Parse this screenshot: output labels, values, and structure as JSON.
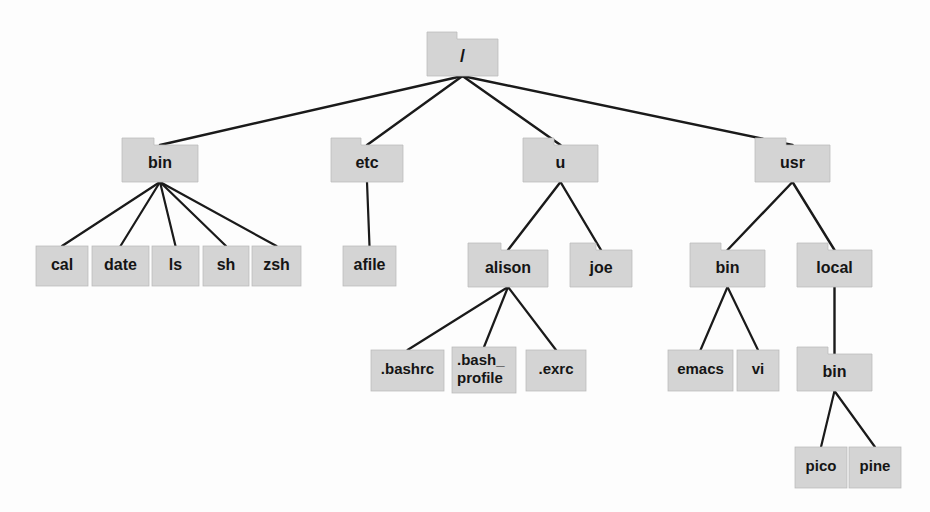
{
  "diagram": {
    "type": "tree",
    "background_color": "#fdfdfd",
    "node_fill_color": "#d4d4d4",
    "node_stroke_color": "#b9b9b9",
    "edge_color": "#1a1a1a",
    "text_color": "#151515"
  },
  "nodes": [
    {
      "id": "root",
      "label": "/",
      "kind": "folder",
      "x": 427,
      "y": 32,
      "w": 71,
      "h": 44,
      "tab_w": 30,
      "tab_h": 7,
      "font_size": 18,
      "lines": [
        "/"
      ]
    },
    {
      "id": "bin",
      "label": "bin",
      "kind": "folder",
      "x": 122,
      "y": 138,
      "w": 76,
      "h": 44,
      "tab_w": 32,
      "tab_h": 7,
      "font_size": 16,
      "lines": [
        "bin"
      ]
    },
    {
      "id": "etc",
      "label": "etc",
      "kind": "folder",
      "x": 331,
      "y": 138,
      "w": 72,
      "h": 44,
      "tab_w": 30,
      "tab_h": 7,
      "font_size": 16,
      "lines": [
        "etc"
      ]
    },
    {
      "id": "u",
      "label": "u",
      "kind": "folder",
      "x": 523,
      "y": 138,
      "w": 75,
      "h": 44,
      "tab_w": 31,
      "tab_h": 7,
      "font_size": 16,
      "lines": [
        "u"
      ]
    },
    {
      "id": "usr",
      "label": "usr",
      "kind": "folder",
      "x": 755,
      "y": 138,
      "w": 75,
      "h": 44,
      "tab_w": 31,
      "tab_h": 7,
      "font_size": 16,
      "lines": [
        "usr"
      ]
    },
    {
      "id": "cal",
      "label": "cal",
      "kind": "file",
      "x": 36,
      "y": 246,
      "w": 52,
      "h": 40,
      "font_size": 16,
      "lines": [
        "cal"
      ]
    },
    {
      "id": "date",
      "label": "date",
      "kind": "file",
      "x": 92,
      "y": 246,
      "w": 57,
      "h": 40,
      "font_size": 16,
      "lines": [
        "date"
      ]
    },
    {
      "id": "ls",
      "label": "ls",
      "kind": "file",
      "x": 152,
      "y": 246,
      "w": 47,
      "h": 40,
      "font_size": 16,
      "lines": [
        "ls"
      ]
    },
    {
      "id": "sh",
      "label": "sh",
      "kind": "file",
      "x": 203,
      "y": 246,
      "w": 46,
      "h": 40,
      "font_size": 16,
      "lines": [
        "sh"
      ]
    },
    {
      "id": "zsh",
      "label": "zsh",
      "kind": "file",
      "x": 252,
      "y": 246,
      "w": 49,
      "h": 40,
      "font_size": 16,
      "lines": [
        "zsh"
      ]
    },
    {
      "id": "afile",
      "label": "afile",
      "kind": "file",
      "x": 343,
      "y": 246,
      "w": 53,
      "h": 40,
      "font_size": 16,
      "lines": [
        "afile"
      ]
    },
    {
      "id": "alison",
      "label": "alison",
      "kind": "folder",
      "x": 468,
      "y": 243,
      "w": 80,
      "h": 44,
      "tab_w": 33,
      "tab_h": 7,
      "font_size": 16,
      "lines": [
        "alison"
      ]
    },
    {
      "id": "joe",
      "label": "joe",
      "kind": "folder",
      "x": 570,
      "y": 243,
      "w": 62,
      "h": 44,
      "tab_w": 26,
      "tab_h": 7,
      "font_size": 16,
      "lines": [
        "joe"
      ]
    },
    {
      "id": "usrbin",
      "label": "bin",
      "kind": "folder",
      "x": 690,
      "y": 243,
      "w": 75,
      "h": 44,
      "tab_w": 31,
      "tab_h": 7,
      "font_size": 16,
      "lines": [
        "bin"
      ]
    },
    {
      "id": "local",
      "label": "local",
      "kind": "folder",
      "x": 797,
      "y": 243,
      "w": 75,
      "h": 44,
      "tab_w": 31,
      "tab_h": 7,
      "font_size": 16,
      "lines": [
        "local"
      ]
    },
    {
      "id": "bashrc",
      "label": ".bashrc",
      "kind": "file",
      "x": 371,
      "y": 350,
      "w": 73,
      "h": 41,
      "font_size": 15,
      "lines": [
        ".bashrc"
      ]
    },
    {
      "id": "bashprofile",
      "label": ".bash_profile",
      "kind": "file",
      "x": 452,
      "y": 347,
      "w": 64,
      "h": 46,
      "font_size": 15,
      "align": "left",
      "lines": [
        ".bash_",
        "profile"
      ]
    },
    {
      "id": "exrc",
      "label": ".exrc",
      "kind": "file",
      "x": 526,
      "y": 350,
      "w": 60,
      "h": 41,
      "font_size": 15,
      "lines": [
        ".exrc"
      ]
    },
    {
      "id": "emacs",
      "label": "emacs",
      "kind": "file",
      "x": 668,
      "y": 350,
      "w": 65,
      "h": 41,
      "font_size": 15,
      "lines": [
        "emacs"
      ]
    },
    {
      "id": "vi",
      "label": "vi",
      "kind": "file",
      "x": 737,
      "y": 350,
      "w": 42,
      "h": 41,
      "font_size": 15,
      "lines": [
        "vi"
      ]
    },
    {
      "id": "localbin",
      "label": "bin",
      "kind": "folder",
      "x": 797,
      "y": 347,
      "w": 75,
      "h": 44,
      "tab_w": 31,
      "tab_h": 7,
      "font_size": 16,
      "lines": [
        "bin"
      ]
    },
    {
      "id": "pico",
      "label": "pico",
      "kind": "file",
      "x": 795,
      "y": 447,
      "w": 52,
      "h": 41,
      "font_size": 15,
      "lines": [
        "pico"
      ]
    },
    {
      "id": "pine",
      "label": "pine",
      "kind": "file",
      "x": 849,
      "y": 447,
      "w": 52,
      "h": 41,
      "font_size": 15,
      "lines": [
        "pine"
      ]
    }
  ],
  "edges": [
    {
      "from": "root",
      "to": "bin",
      "width": 2.4
    },
    {
      "from": "root",
      "to": "etc",
      "width": 2.4
    },
    {
      "from": "root",
      "to": "u",
      "width": 2.4
    },
    {
      "from": "root",
      "to": "usr",
      "width": 2.4
    },
    {
      "from": "bin",
      "to": "cal",
      "width": 2.2
    },
    {
      "from": "bin",
      "to": "date",
      "width": 2.2
    },
    {
      "from": "bin",
      "to": "ls",
      "width": 2.2
    },
    {
      "from": "bin",
      "to": "sh",
      "width": 2.2
    },
    {
      "from": "bin",
      "to": "zsh",
      "width": 2.2
    },
    {
      "from": "etc",
      "to": "afile",
      "width": 2.2
    },
    {
      "from": "u",
      "to": "alison",
      "width": 2.4
    },
    {
      "from": "u",
      "to": "joe",
      "width": 2.4
    },
    {
      "from": "usr",
      "to": "usrbin",
      "width": 2.4
    },
    {
      "from": "usr",
      "to": "local",
      "width": 2.4
    },
    {
      "from": "alison",
      "to": "bashrc",
      "width": 2.2
    },
    {
      "from": "alison",
      "to": "bashprofile",
      "width": 2.2
    },
    {
      "from": "alison",
      "to": "exrc",
      "width": 2.2
    },
    {
      "from": "usrbin",
      "to": "emacs",
      "width": 2.2
    },
    {
      "from": "usrbin",
      "to": "vi",
      "width": 2.2
    },
    {
      "from": "local",
      "to": "localbin",
      "width": 2.4
    },
    {
      "from": "localbin",
      "to": "pico",
      "width": 2.2
    },
    {
      "from": "localbin",
      "to": "pine",
      "width": 2.2
    }
  ]
}
